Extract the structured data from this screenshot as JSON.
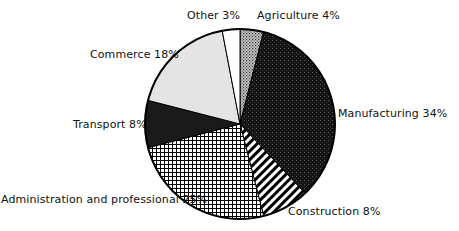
{
  "chart_data": {
    "type": "pie",
    "title": "",
    "start_angle_deg": 0,
    "direction": "clockwise",
    "center": [
      240,
      124
    ],
    "radius": 95,
    "slices": [
      {
        "label": "Agriculture",
        "value": 4,
        "text": "Agriculture 4%",
        "fill": "dots",
        "color": "#9a9a9a"
      },
      {
        "label": "Manufacturing",
        "value": 34,
        "text": "Manufacturing 34%",
        "fill": "dense-dark",
        "color": "#1c1c1c"
      },
      {
        "label": "Construction",
        "value": 8,
        "text": "Construction 8%",
        "fill": "diagonal-stripes",
        "color": "#000000"
      },
      {
        "label": "Administration and professional",
        "value": 25,
        "text": "Administration and professional 25%",
        "fill": "grid",
        "color": "#000000"
      },
      {
        "label": "Transport",
        "value": 8,
        "text": "Transport 8%",
        "fill": "solid",
        "color": "#1a1a1a"
      },
      {
        "label": "Commerce",
        "value": 18,
        "text": "Commerce 18%",
        "fill": "solid",
        "color": "#e4e4e4"
      },
      {
        "label": "Other",
        "value": 3,
        "text": "Other 3%",
        "fill": "solid",
        "color": "#ffffff"
      }
    ],
    "legend": "none (direct labels)"
  },
  "labels": {
    "agriculture": "Agriculture 4%",
    "manufacturing": "Manufacturing 34%",
    "construction": "Construction 8%",
    "administration": "Administration and professional 25%",
    "transport": "Transport 8%",
    "commerce": "Commerce 18%",
    "other": "Other 3%"
  }
}
